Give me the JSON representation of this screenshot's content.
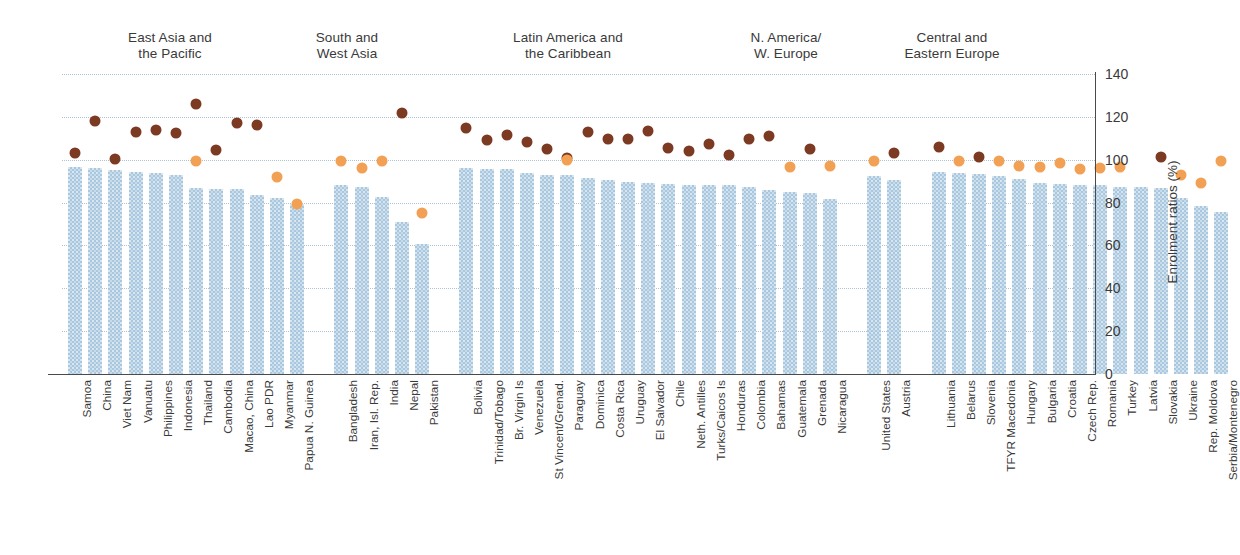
{
  "chart_data": {
    "type": "bar",
    "title": "",
    "xlabel": "",
    "ylabel": "Enrolment ratios (%)",
    "ylim": [
      0,
      140
    ],
    "yticks": [
      0,
      20,
      40,
      60,
      80,
      100,
      120,
      140
    ],
    "grid": true,
    "legend_position": "none",
    "series": [
      {
        "name": "Net enrolment ratio (bar)",
        "type": "bar",
        "color": "#a9c7de"
      },
      {
        "name": "Gross enrolment ratio - male (dark dot)",
        "type": "scatter",
        "color": "#7c3a22"
      },
      {
        "name": "Gross enrolment ratio - female (orange dot)",
        "type": "scatter",
        "color": "#f2a154"
      }
    ],
    "groups": [
      {
        "label": "East Asia and\nthe Pacific",
        "categories": [
          "Samoa",
          "China",
          "Viet Nam",
          "Vanuatu",
          "Philippines",
          "Indonesia",
          "Thailand",
          "Cambodia",
          "Macao, China",
          "Lao PDR",
          "Myanmar",
          "Papua N. Guinea"
        ],
        "bar": [
          96.5,
          96.0,
          95.0,
          94.5,
          94.0,
          93.0,
          87.0,
          86.5,
          86.5,
          83.5,
          82.0,
          79.5
        ],
        "male": [
          103.0,
          118.0,
          100.5,
          113.0,
          114.0,
          112.5,
          126.0,
          104.5,
          117.0,
          116.0,
          null,
          null
        ],
        "female": [
          null,
          null,
          null,
          null,
          null,
          null,
          99.5,
          null,
          null,
          null,
          92.0,
          79.5
        ]
      },
      {
        "label": "South and\nWest Asia",
        "categories": [
          "Bangladesh",
          "Iran, Isl. Rep.",
          "India",
          "Nepal",
          "Pakistan"
        ],
        "bar": [
          88.0,
          87.5,
          82.5,
          71.0,
          60.5
        ],
        "male": [
          null,
          null,
          null,
          122.0,
          null
        ],
        "female": [
          99.5,
          96.0,
          99.5,
          null,
          75.0
        ]
      },
      {
        "label": "Latin America and\nthe Caribbean",
        "categories": [
          "Bolivia",
          "Trinidad/Tobago",
          "Br. Virgin Is",
          "Venezuela",
          "St Vincent/Grenad.",
          "Paraguay",
          "Dominica",
          "Costa Rica",
          "Uruguay",
          "El Salvador",
          "Chile",
          "Neth. Antilles",
          "Turks/Caicos Is",
          "Honduras",
          "Colombia",
          "Bahamas",
          "Guatemala",
          "Grenada",
          "Nicaragua"
        ],
        "bar": [
          96.0,
          95.5,
          95.5,
          94.0,
          93.0,
          93.0,
          91.5,
          90.5,
          89.5,
          89.0,
          88.5,
          88.0,
          88.0,
          88.0,
          87.5,
          86.0,
          85.0,
          84.5,
          81.5
        ],
        "male": [
          115.0,
          109.0,
          111.5,
          108.5,
          105.0,
          101.0,
          113.0,
          109.5,
          109.5,
          113.5,
          105.5,
          104.0,
          107.5,
          102.0,
          109.5,
          111.0,
          null,
          105.0,
          null
        ],
        "female": [
          null,
          null,
          null,
          null,
          null,
          100.0,
          null,
          null,
          null,
          null,
          null,
          null,
          null,
          null,
          null,
          null,
          96.5,
          null,
          97.0
        ]
      },
      {
        "label": "N. America/\nW. Europe",
        "categories": [
          "United States",
          "Austria"
        ],
        "bar": [
          92.5,
          90.5
        ],
        "male": [
          null,
          103.0
        ],
        "female": [
          99.5,
          null
        ]
      },
      {
        "label": "Central and\nEastern Europe",
        "categories": [
          "Lithuania",
          "Belarus",
          "Slovenia",
          "TFYR Macedonia",
          "Hungary",
          "Bulgaria",
          "Croatia",
          "Czech Rep.",
          "Romania",
          "Turkey",
          "Latvia",
          "Slovakia",
          "Ukraine",
          "Rep. Moldova",
          "Serbia/Montenegro"
        ],
        "bar": [
          94.5,
          94.0,
          93.5,
          92.5,
          91.0,
          89.0,
          88.5,
          88.0,
          88.0,
          87.5,
          87.5,
          87.0,
          82.0,
          78.5,
          75.5
        ],
        "male": [
          106.0,
          null,
          101.5,
          null,
          null,
          null,
          null,
          null,
          null,
          null,
          null,
          101.5,
          null,
          null,
          null
        ],
        "female": [
          null,
          99.5,
          null,
          99.5,
          97.0,
          96.5,
          98.5,
          95.5,
          96.0,
          96.5,
          null,
          null,
          93.0,
          89.0,
          99.5
        ]
      }
    ]
  }
}
